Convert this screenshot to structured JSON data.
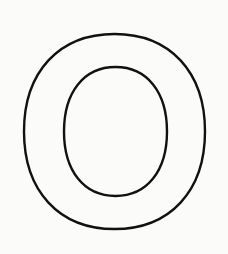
{
  "image": {
    "subject": "Outlined letter O",
    "letter": "O",
    "background_color": "#fbfbfa",
    "stroke_color": "#111111",
    "stroke_width": 2.4
  },
  "shapes": {
    "outer": {
      "x": 24,
      "y": 34,
      "width": 181,
      "height": 195
    },
    "inner": {
      "x": 64,
      "y": 67,
      "width": 103,
      "height": 129
    }
  }
}
